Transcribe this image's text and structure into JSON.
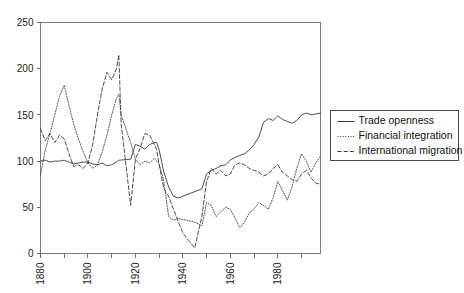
{
  "chart_data": {
    "type": "line",
    "title": "",
    "subtitle": "",
    "xlabel": "",
    "ylabel": "",
    "xlim": [
      1880,
      1998
    ],
    "ylim": [
      0,
      250
    ],
    "grid": false,
    "legend_position": "right-outside",
    "x_ticks_major": [
      1880,
      1900,
      1920,
      1940,
      1960,
      1980
    ],
    "x_tick_labels": [
      "1880",
      "1900",
      "1920",
      "1940",
      "1960",
      "1980"
    ],
    "x_ticks_minor": [
      1890,
      1910,
      1930,
      1950,
      1970,
      1990
    ],
    "y_ticks": [
      0,
      50,
      100,
      150,
      200,
      250
    ],
    "y_tick_labels": [
      "0",
      "50",
      "100",
      "150",
      "200",
      "250"
    ],
    "series": [
      {
        "name": "Trade openness",
        "style": "solid",
        "color": "#3a3a3a",
        "x": [
          1880,
          1882,
          1884,
          1886,
          1888,
          1890,
          1892,
          1894,
          1896,
          1898,
          1900,
          1902,
          1904,
          1906,
          1908,
          1910,
          1912,
          1913,
          1918,
          1920,
          1922,
          1924,
          1926,
          1928,
          1929,
          1930,
          1932,
          1934,
          1936,
          1938,
          1948,
          1950,
          1952,
          1954,
          1956,
          1958,
          1960,
          1962,
          1964,
          1966,
          1968,
          1970,
          1972,
          1974,
          1976,
          1978,
          1980,
          1982,
          1984,
          1986,
          1988,
          1990,
          1992,
          1994,
          1996,
          1998
        ],
        "y": [
          100,
          101,
          99,
          100,
          100,
          101,
          99,
          97,
          98,
          99,
          99,
          97,
          96,
          98,
          95,
          96,
          99,
          101,
          102,
          118,
          116,
          113,
          118,
          120,
          120,
          112,
          88,
          72,
          62,
          60,
          70,
          86,
          90,
          92,
          95,
          96,
          101,
          104,
          106,
          108,
          112,
          118,
          126,
          142,
          146,
          144,
          149,
          145,
          143,
          141,
          144,
          150,
          152,
          150,
          151,
          152
        ]
      },
      {
        "name": "Financial integration",
        "style": "dotted",
        "color": "#3a3a3a",
        "x": [
          1880,
          1882,
          1884,
          1886,
          1888,
          1890,
          1892,
          1894,
          1896,
          1898,
          1900,
          1902,
          1904,
          1906,
          1908,
          1910,
          1912,
          1913,
          1914,
          1918,
          1920,
          1922,
          1924,
          1926,
          1928,
          1929,
          1930,
          1932,
          1934,
          1936,
          1938,
          1945,
          1948,
          1950,
          1952,
          1954,
          1956,
          1958,
          1960,
          1962,
          1964,
          1966,
          1968,
          1970,
          1972,
          1974,
          1976,
          1978,
          1980,
          1982,
          1984,
          1986,
          1988,
          1990,
          1992,
          1994,
          1996,
          1998
        ],
        "y": [
          85,
          112,
          130,
          150,
          170,
          182,
          160,
          140,
          124,
          110,
          98,
          92,
          96,
          110,
          128,
          150,
          168,
          172,
          150,
          120,
          102,
          96,
          100,
          98,
          103,
          100,
          97,
          78,
          40,
          36,
          38,
          34,
          30,
          55,
          52,
          40,
          45,
          50,
          48,
          38,
          28,
          34,
          44,
          48,
          55,
          52,
          48,
          60,
          78,
          68,
          58,
          72,
          92,
          108,
          100,
          88,
          98,
          105
        ]
      },
      {
        "name": "International migration",
        "style": "dashed",
        "color": "#3a3a3a",
        "x": [
          1880,
          1882,
          1884,
          1886,
          1888,
          1890,
          1892,
          1894,
          1896,
          1898,
          1900,
          1902,
          1904,
          1906,
          1908,
          1910,
          1912,
          1913,
          1914,
          1918,
          1920,
          1922,
          1924,
          1926,
          1928,
          1929,
          1930,
          1932,
          1934,
          1936,
          1938,
          1940,
          1945,
          1948,
          1950,
          1952,
          1954,
          1956,
          1958,
          1960,
          1962,
          1964,
          1966,
          1968,
          1970,
          1972,
          1974,
          1976,
          1978,
          1980,
          1982,
          1984,
          1986,
          1988,
          1990,
          1992,
          1994,
          1996,
          1998
        ],
        "y": [
          135,
          122,
          130,
          120,
          128,
          124,
          108,
          94,
          96,
          92,
          98,
          118,
          150,
          178,
          196,
          188,
          200,
          215,
          140,
          52,
          102,
          114,
          130,
          128,
          118,
          112,
          96,
          70,
          62,
          48,
          35,
          22,
          6,
          40,
          78,
          92,
          86,
          90,
          84,
          86,
          96,
          98,
          96,
          92,
          90,
          88,
          84,
          86,
          92,
          96,
          88,
          84,
          80,
          78,
          86,
          90,
          82,
          76,
          75
        ]
      }
    ]
  },
  "legend": {
    "items": [
      {
        "label": "Trade openness",
        "style": "solid"
      },
      {
        "label": "Financial integration",
        "style": "dotted"
      },
      {
        "label": "International migration",
        "style": "dashed"
      }
    ]
  }
}
